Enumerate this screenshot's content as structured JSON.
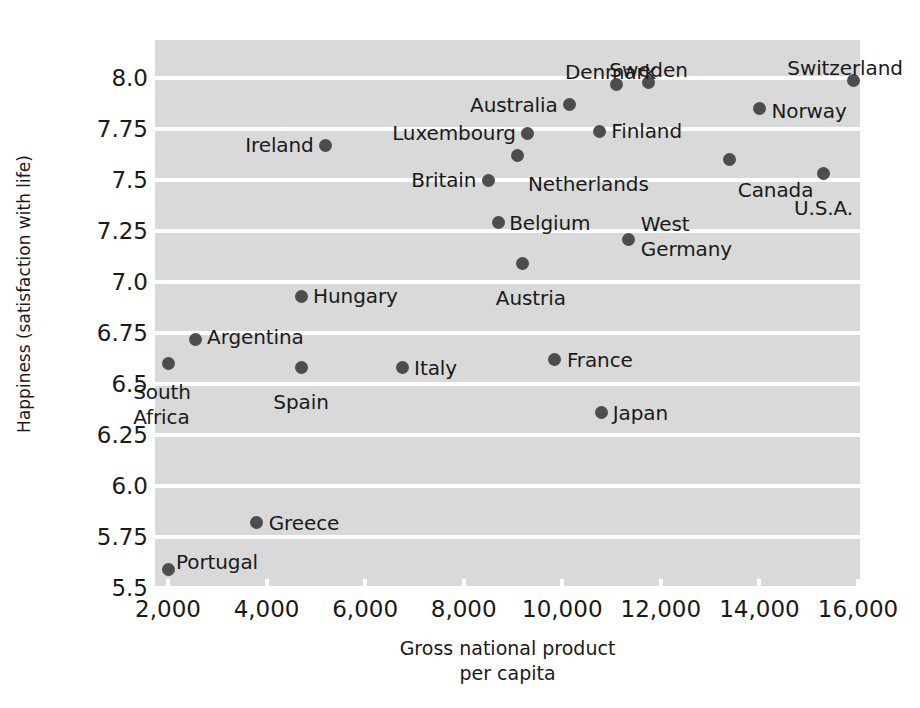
{
  "chart_data": {
    "type": "scatter",
    "title": "",
    "xlabel": "Gross national product\nper capita",
    "xlabel_line1": "Gross national product",
    "xlabel_line2": "per capita",
    "ylabel": "Happiness (satisfaction with life)",
    "xlim": [
      1600,
      16700
    ],
    "ylim": [
      5.5,
      8.08
    ],
    "grid": "horizontal-white-bands",
    "legend": "none",
    "xticks": [
      2000,
      4000,
      6000,
      8000,
      10000,
      12000,
      14000,
      16000
    ],
    "xtick_labels": [
      "2,000",
      "4,000",
      "6,000",
      "8,000",
      "10,000",
      "12,000",
      "14,000",
      "16,000"
    ],
    "yticks": [
      5.5,
      5.75,
      6.0,
      6.25,
      6.5,
      6.75,
      7.0,
      7.25,
      7.5,
      7.75,
      8.0
    ],
    "ytick_labels": [
      "5.5",
      "5.75",
      "6.0",
      "6.25",
      "6.5",
      "6.75",
      "7.0",
      "7.25",
      "7.5",
      "7.75",
      "8.0"
    ],
    "point_color": "#4d4d4d",
    "plot_background": "#d9d9d9",
    "points": [
      {
        "name": "Switzerland",
        "x": 15900,
        "y": 7.99,
        "label_pos": "above-left",
        "label_dx": -8,
        "label_dy": -24
      },
      {
        "name": "Sweden",
        "x": 11750,
        "y": 7.98,
        "label_pos": "above",
        "label_dx": 0,
        "label_dy": -24
      },
      {
        "name": "Denmark",
        "x": 11100,
        "y": 7.97,
        "label_pos": "above",
        "label_dx": -6,
        "label_dy": -24
      },
      {
        "name": "Norway",
        "x": 14000,
        "y": 7.85,
        "label_pos": "right",
        "label_dx": 12,
        "label_dy": 2
      },
      {
        "name": "Australia",
        "x": 10150,
        "y": 7.87,
        "label_pos": "left",
        "label_dx": -12,
        "label_dy": 0
      },
      {
        "name": "Finland",
        "x": 10750,
        "y": 7.74,
        "label_pos": "right",
        "label_dx": 12,
        "label_dy": 0
      },
      {
        "name": "Luxembourg",
        "x": 9300,
        "y": 7.73,
        "label_pos": "left",
        "label_dx": -12,
        "label_dy": 0
      },
      {
        "name": "Netherlands",
        "x": 9100,
        "y": 7.62,
        "label_pos": "below-right",
        "label_dx": 10,
        "label_dy": 16
      },
      {
        "name": "Canada",
        "x": 13400,
        "y": 7.6,
        "label_pos": "below-left",
        "label_dx": 8,
        "label_dy": 18
      },
      {
        "name": "U.S.A.",
        "x": 15300,
        "y": 7.53,
        "label_pos": "below",
        "label_dx": 0,
        "label_dy": 22
      },
      {
        "name": "Britain",
        "x": 8500,
        "y": 7.5,
        "label_pos": "left",
        "label_dx": -12,
        "label_dy": 0
      },
      {
        "name": "Ireland",
        "x": 5200,
        "y": 7.67,
        "label_pos": "left",
        "label_dx": -12,
        "label_dy": 0
      },
      {
        "name": "Belgium",
        "x": 8700,
        "y": 7.29,
        "label_pos": "right",
        "label_dx": 11,
        "label_dy": 0
      },
      {
        "name": "West Germany",
        "x": 11350,
        "y": 7.21,
        "label_pos": "right-2line",
        "label_dx": 12,
        "label_dy": -2
      },
      {
        "name": "Austria",
        "x": 9200,
        "y": 7.09,
        "label_pos": "below",
        "label_dx": 8,
        "label_dy": 22
      },
      {
        "name": "Hungary",
        "x": 4700,
        "y": 6.93,
        "label_pos": "right",
        "label_dx": 12,
        "label_dy": 0
      },
      {
        "name": "Argentina",
        "x": 2550,
        "y": 6.72,
        "label_pos": "right",
        "label_dx": 12,
        "label_dy": -2
      },
      {
        "name": "France",
        "x": 9850,
        "y": 6.62,
        "label_pos": "right",
        "label_dx": 12,
        "label_dy": 0
      },
      {
        "name": "Italy",
        "x": 6750,
        "y": 6.58,
        "label_pos": "right",
        "label_dx": 12,
        "label_dy": 0
      },
      {
        "name": "Spain",
        "x": 4700,
        "y": 6.58,
        "label_pos": "below",
        "label_dx": 0,
        "label_dy": 22
      },
      {
        "name": "South Africa",
        "x": 2000,
        "y": 6.6,
        "label_pos": "below-2line",
        "label_dx": -6,
        "label_dy": 16
      },
      {
        "name": "Japan",
        "x": 10800,
        "y": 6.36,
        "label_pos": "right",
        "label_dx": 11,
        "label_dy": 0
      },
      {
        "name": "Greece",
        "x": 3800,
        "y": 5.82,
        "label_pos": "right",
        "label_dx": 12,
        "label_dy": 0
      },
      {
        "name": "Portugal",
        "x": 2000,
        "y": 5.59,
        "label_pos": "above-right",
        "label_dx": 8,
        "label_dy": -20
      }
    ]
  }
}
